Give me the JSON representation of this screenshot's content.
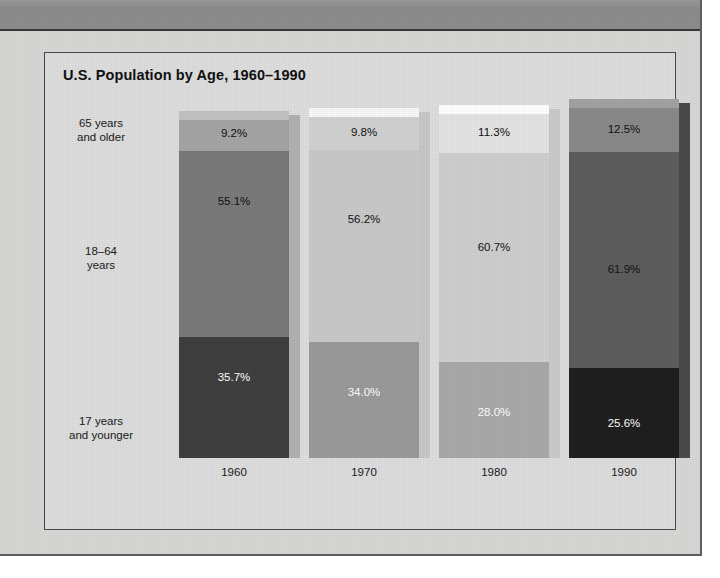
{
  "chart": {
    "title": "U.S. Population by Age, 1960–1990",
    "frame_bg": "#dedede",
    "page_bg": "#d8d8d6",
    "header_band_color": "#8d8d8d"
  },
  "chart_data": {
    "type": "bar",
    "subtype": "stacked-column-100pct-3d",
    "title": "U.S. Population by Age, 1960–1990",
    "xlabel": "",
    "ylabel": "",
    "categories": [
      "1960",
      "1970",
      "1980",
      "1990"
    ],
    "grid": false,
    "legend": "row-labels-left",
    "ylim": [
      0,
      100
    ],
    "series": [
      {
        "name": "17 years and younger",
        "values": [
          35.7,
          34.0,
          28.0,
          25.6
        ],
        "value_labels": [
          "35.7%",
          "34.0%",
          "28.0%",
          "25.6%"
        ],
        "label_color": "#ffffff",
        "colors": [
          "#3f3f3f",
          "#9a9a9a",
          "#a9a9a9",
          "#1f1f1f"
        ]
      },
      {
        "name": "18–64 years",
        "values": [
          55.1,
          56.2,
          60.7,
          61.9
        ],
        "value_labels": [
          "55.1%",
          "56.2%",
          "60.7%",
          "61.9%"
        ],
        "label_color": "#111111",
        "colors": [
          "#7a7a7a",
          "#c9c9c9",
          "#cfcfcf",
          "#5e5e5e"
        ]
      },
      {
        "name": "65 years and older",
        "values": [
          9.2,
          9.8,
          11.3,
          12.5
        ],
        "value_labels": [
          "9.2%",
          "9.8%",
          "11.3%",
          "12.5%"
        ],
        "label_color": "#111111",
        "colors": [
          "#a5a5a5",
          "#d2d2d2",
          "#e4e4e4",
          "#8a8a8a"
        ]
      }
    ],
    "row_labels": [
      "65 years\nand older",
      "18–64\nyears",
      "17 years\nand younger"
    ]
  },
  "axis": {
    "years": [
      "1960",
      "1970",
      "1980",
      "1990"
    ]
  },
  "row_labels": [
    {
      "line1": "65 years",
      "line2": "and older"
    },
    {
      "line1": "18–64",
      "line2": "years"
    },
    {
      "line1": "17 years",
      "line2": "and younger"
    }
  ]
}
